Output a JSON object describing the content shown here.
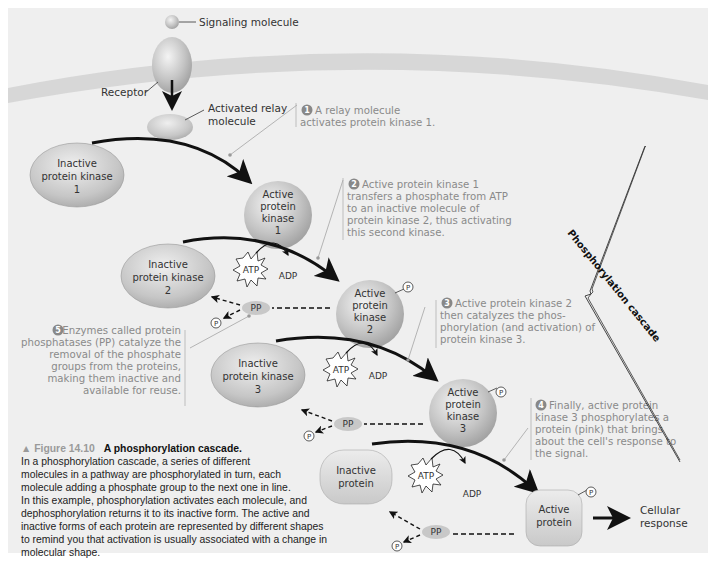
{
  "figure": {
    "number": "▲ Figure 14.10",
    "title": "A phosphorylation cascade.",
    "caption_lines": [
      "In a phosphorylation cascade, a series of different",
      "molecules in a pathway are phosphorylated in turn, each",
      "molecule adding a phosphate group to the next one in line.",
      "In this example, phosphorylation activates each molecule, and",
      "dephosphorylation returns it to its inactive form. The active and",
      "inactive forms of each protein are represented by different shapes",
      "to remind you that activation is usually associated with a change in",
      "molecular shape."
    ]
  },
  "labels": {
    "signaling_molecule": "Signaling molecule",
    "receptor": "Receptor",
    "relay_line1": "Activated relay",
    "relay_line2": "molecule",
    "cascade": "Phosphorylation cascade",
    "cellular_line1": "Cellular",
    "cellular_line2": "response"
  },
  "shapes": {
    "inactive_pk1": [
      "Inactive",
      "protein kinase",
      "1"
    ],
    "active_pk1": [
      "Active",
      "protein",
      "kinase",
      "1"
    ],
    "inactive_pk2": [
      "Inactive",
      "protein kinase",
      "2"
    ],
    "active_pk2": [
      "Active",
      "protein",
      "kinase",
      "2"
    ],
    "inactive_pk3": [
      "Inactive",
      "protein kinase",
      "3"
    ],
    "active_pk3": [
      "Active",
      "protein",
      "kinase",
      "3"
    ],
    "inactive_protein": [
      "Inactive",
      "protein"
    ],
    "active_protein": [
      "Active",
      "protein"
    ]
  },
  "molecules": {
    "atp": "ATP",
    "adp": "ADP",
    "pp": "PP",
    "p": "P",
    "pi_sub": "i"
  },
  "steps": [
    {
      "num": "1",
      "lines": [
        "A relay molecule",
        "activates protein kinase 1."
      ]
    },
    {
      "num": "2",
      "lines": [
        "Active protein kinase 1",
        "transfers a phosphate from ATP",
        "to an inactive molecule of",
        "protein kinase 2, thus activating",
        "this second kinase."
      ]
    },
    {
      "num": "3",
      "lines": [
        "Active protein kinase 2",
        "then catalyzes the phos-",
        "phorylation (and activation) of",
        "protein kinase 3."
      ]
    },
    {
      "num": "4",
      "lines": [
        "Finally, active protein",
        "kinase 3 phosphorylates a",
        "protein (pink) that brings",
        "about the cell's response to",
        "the signal."
      ]
    },
    {
      "num": "5",
      "lines": [
        "Enzymes called protein",
        "phosphatases (PP) catalyze the",
        "removal of the phosphate",
        "groups from the proteins,",
        "making them inactive and",
        "available for reuse."
      ]
    }
  ],
  "colors": {
    "background": "#efefef",
    "membrane": "#d6d6d6",
    "protein_fill": "#bdbdbd",
    "step_text": "#8a8a8a",
    "arrow": "#111111"
  }
}
